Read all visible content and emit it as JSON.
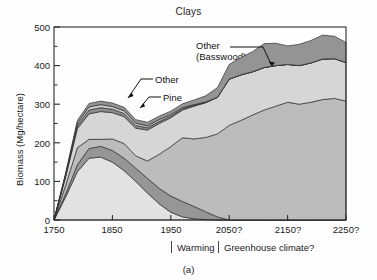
{
  "figure": {
    "title": "Clays",
    "panel_label": "(a)",
    "width": 377,
    "height": 280
  },
  "axes": {
    "ylabel": "Biomass (Mg/hectare)",
    "yticks": [
      "0",
      "100",
      "200",
      "300",
      "400",
      "500"
    ],
    "xticks": [
      "1750",
      "1850",
      "1950",
      "2050?",
      "2150?",
      "2250?"
    ]
  },
  "era_bar": {
    "warming": "Warming",
    "greenhouse": "Greenhouse climate?"
  },
  "annotations": {
    "basswood_line1": "Other",
    "basswood_line2": "(Basswood)",
    "other": "Other",
    "pine": "Pine",
    "birch": "Birch",
    "maple": "Maple",
    "aspen": "Aspen",
    "spruce": "Spruce"
  },
  "colors": {
    "aspen": "#e2e2e2",
    "spruce": "#969696",
    "maple": "#bcbcbc",
    "birch": "#d6d6d6",
    "pine": "#8d8d8d",
    "other": "#cfcfcf",
    "basswood": "#949494",
    "frame": "#2b2b2b",
    "text": "#1a1a1a"
  },
  "chart_data": {
    "type": "area",
    "stacked": true,
    "title": "Clays",
    "xlabel": "",
    "ylabel": "Biomass (Mg/hectare)",
    "xlim": [
      1750,
      2250
    ],
    "ylim": [
      0,
      500
    ],
    "grid": false,
    "legend": "inline-labels",
    "xtick_values": [
      1750,
      1850,
      1950,
      2050,
      2150,
      2250
    ],
    "ytick_values": [
      0,
      100,
      200,
      300,
      400,
      500
    ],
    "minor_ytick_values": [
      50,
      150,
      250,
      350,
      450
    ],
    "x": [
      1750,
      1770,
      1790,
      1810,
      1830,
      1850,
      1870,
      1890,
      1910,
      1930,
      1950,
      1970,
      1990,
      2010,
      2030,
      2050,
      2070,
      2090,
      2110,
      2130,
      2150,
      2170,
      2190,
      2210,
      2230,
      2250
    ],
    "series": [
      {
        "name": "Aspen",
        "values": [
          0,
          60,
          125,
          160,
          163,
          150,
          128,
          100,
          70,
          42,
          20,
          8,
          3,
          1,
          0,
          0,
          0,
          0,
          0,
          0,
          0,
          0,
          0,
          0,
          0,
          0
        ]
      },
      {
        "name": "Spruce",
        "values": [
          0,
          8,
          18,
          25,
          28,
          30,
          32,
          34,
          38,
          40,
          42,
          40,
          32,
          20,
          8,
          0,
          0,
          0,
          0,
          0,
          0,
          0,
          0,
          0,
          0,
          0
        ]
      },
      {
        "name": "Maple",
        "values": [
          0,
          22,
          44,
          24,
          18,
          30,
          38,
          32,
          45,
          88,
          128,
          165,
          175,
          193,
          215,
          245,
          258,
          272,
          285,
          295,
          305,
          300,
          305,
          312,
          315,
          308
        ]
      },
      {
        "name": "Birch",
        "values": [
          0,
          22,
          50,
          66,
          72,
          68,
          70,
          72,
          80,
          80,
          75,
          72,
          85,
          90,
          95,
          120,
          118,
          112,
          110,
          105,
          98,
          100,
          102,
          105,
          103,
          100
        ]
      },
      {
        "name": "Pine",
        "values": [
          0,
          4,
          8,
          10,
          10,
          9,
          8,
          7,
          6,
          5,
          4,
          3,
          2,
          1,
          0,
          0,
          0,
          0,
          0,
          0,
          0,
          0,
          0,
          0,
          0,
          0
        ]
      },
      {
        "name": "Other",
        "values": [
          0,
          3,
          6,
          8,
          8,
          7,
          7,
          6,
          5,
          5,
          4,
          3,
          2,
          1,
          0,
          0,
          0,
          0,
          0,
          0,
          0,
          0,
          0,
          0,
          0,
          0
        ]
      },
      {
        "name": "Other (Basswood)",
        "values": [
          0,
          3,
          7,
          9,
          9,
          9,
          9,
          9,
          9,
          9,
          9,
          10,
          12,
          16,
          25,
          38,
          45,
          52,
          62,
          58,
          48,
          55,
          58,
          62,
          58,
          52
        ]
      }
    ]
  }
}
